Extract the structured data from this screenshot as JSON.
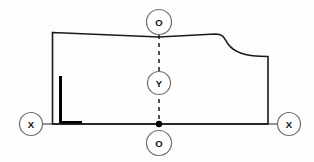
{
  "diagram": {
    "background_color": "#fdfdfd",
    "line_color": "#1a1a1a",
    "accent_fill": "#000000",
    "callouts": [
      {
        "id": "callout-top",
        "label": "O",
        "cx": 159,
        "cy": 22,
        "r": 12.5
      },
      {
        "id": "callout-middle",
        "label": "Y",
        "cx": 159,
        "cy": 83,
        "r": 11.5
      },
      {
        "id": "callout-bottom",
        "label": "O",
        "cx": 159,
        "cy": 143,
        "r": 12.5
      },
      {
        "id": "callout-left",
        "label": "X",
        "cx": 31,
        "cy": 124,
        "r": 11.5
      },
      {
        "id": "callout-right",
        "label": "X",
        "cx": 289,
        "cy": 124,
        "r": 11.5
      }
    ],
    "outline": {
      "name": "profile-outline",
      "path": "M 52.5 32.5 L 159 37 L 215 34 C 224 34 224 38 228 44 C 234 52 244 56.5 268 56.5 L 268 124 L 52.5 124 Z"
    },
    "centerline": {
      "name": "vertical-centerline",
      "x": 159,
      "y_top": 35,
      "y_bottom": 131,
      "dash": "4,4"
    },
    "datum_line": {
      "name": "horizontal-datum-line",
      "y": 124,
      "x_start": 52.5,
      "x_end": 268
    },
    "leaders": [
      {
        "name": "leader-left",
        "x1": 43,
        "y1": 124,
        "x2": 52.5,
        "y2": 124
      },
      {
        "name": "leader-right",
        "x1": 268,
        "y1": 124,
        "x2": 277.5,
        "y2": 124
      }
    ],
    "origin_dot": {
      "name": "origin-point",
      "cx": 159,
      "cy": 124,
      "r": 3.2
    },
    "thick_mark": {
      "name": "thick-reference-bracket",
      "path": "M 62 76 L 62 121 L 82 121 L 82 124 L 59 124 L 59 76 Z"
    }
  }
}
